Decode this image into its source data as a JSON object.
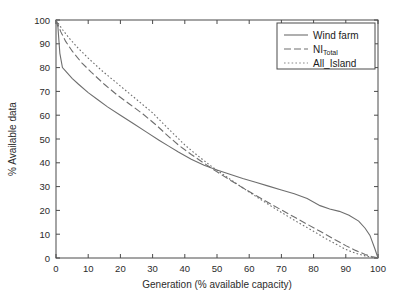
{
  "chart_data": {
    "type": "line",
    "title": "",
    "xlabel": "Generation (% available capacity)",
    "ylabel": "% Available data",
    "xlim": [
      0,
      100
    ],
    "ylim": [
      0,
      100
    ],
    "xticks": [
      0,
      10,
      20,
      30,
      40,
      50,
      60,
      70,
      80,
      90,
      100
    ],
    "yticks": [
      0,
      10,
      20,
      30,
      40,
      50,
      60,
      70,
      80,
      90,
      100
    ],
    "grid": false,
    "legend_position": "top-right",
    "series": [
      {
        "name": "Wind farm",
        "style": "solid",
        "color": "#6e6e6e",
        "x": [
          0,
          0.6,
          1.2,
          2,
          3,
          5,
          7,
          10,
          13,
          16,
          20,
          24,
          28,
          32,
          35,
          38,
          42,
          46,
          50,
          54,
          58,
          62,
          66,
          70,
          74,
          78,
          82,
          85,
          88,
          91,
          94,
          96,
          97.5,
          99,
          100
        ],
        "y": [
          100,
          97,
          86,
          80,
          78.5,
          75.5,
          73,
          69.5,
          66.5,
          63.5,
          60,
          56.5,
          53,
          49.5,
          47,
          44.5,
          41.5,
          39,
          37,
          35.2,
          33.4,
          31.8,
          30.2,
          28.6,
          27,
          25,
          22,
          20.6,
          19.6,
          18,
          15.5,
          12.5,
          9.5,
          4,
          0
        ]
      },
      {
        "name": "NI_Total",
        "style": "dashed",
        "color": "#6e6e6e",
        "x": [
          0,
          0.5,
          1.5,
          3,
          5,
          8,
          11,
          15,
          19,
          23,
          27,
          31,
          35,
          38,
          42,
          46,
          50,
          54,
          58,
          62,
          66,
          70,
          74,
          78,
          82,
          86,
          90,
          93,
          96,
          98,
          100
        ],
        "y": [
          100,
          98.5,
          95,
          91,
          87,
          82,
          78,
          73,
          68.5,
          64.5,
          60.5,
          56,
          51,
          47.5,
          43.5,
          39.8,
          36.2,
          32.8,
          29.5,
          26.3,
          23.2,
          20.2,
          17.2,
          14.2,
          11.2,
          8.2,
          5.2,
          3.2,
          1.5,
          0.6,
          0
        ]
      },
      {
        "name": "All_Island",
        "style": "dotted",
        "color": "#8a8a8a",
        "x": [
          0,
          0.5,
          2,
          4,
          7,
          10,
          14,
          18,
          22,
          26,
          30,
          34,
          37,
          40,
          44,
          48,
          52,
          56,
          60,
          64,
          68,
          72,
          76,
          80,
          84,
          87,
          90,
          93,
          96,
          98,
          100
        ],
        "y": [
          100,
          99,
          96,
          92.5,
          88,
          84,
          79,
          74.5,
          70,
          65.5,
          61,
          55.5,
          51.5,
          47.5,
          43,
          38.8,
          35,
          31.3,
          27.7,
          24.2,
          20.8,
          17.5,
          14.3,
          11.2,
          8,
          5.8,
          3.6,
          2.0,
          0.9,
          0.3,
          0
        ]
      }
    ],
    "legend": [
      {
        "label": "Wind farm",
        "sub": "",
        "style": "solid"
      },
      {
        "label": "NI",
        "sub": "Total",
        "style": "dashed"
      },
      {
        "label": "All_Island",
        "sub": "",
        "style": "dotted"
      }
    ]
  }
}
